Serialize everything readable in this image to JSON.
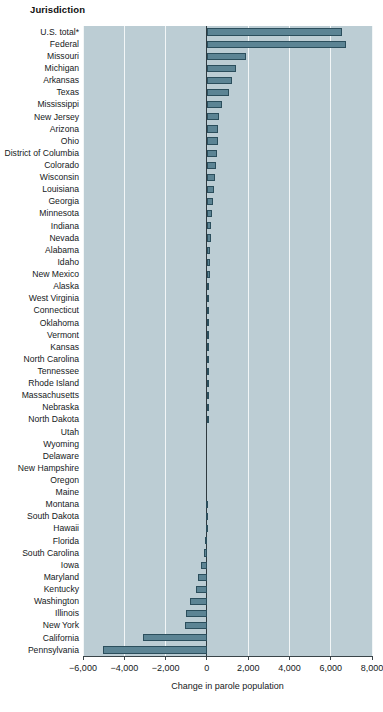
{
  "header": {
    "column_label": "Jurisdiction"
  },
  "chart_data": {
    "type": "bar",
    "orientation": "horizontal",
    "title": "",
    "xlabel": "Change in parole population",
    "ylabel": "Jurisdiction",
    "xlim": [
      -6000,
      8000
    ],
    "xticks": [
      -6000,
      -4000,
      -2000,
      0,
      2000,
      4000,
      6000,
      8000
    ],
    "xticklabels": [
      "−6,000",
      "−4,000",
      "−2,000",
      "0",
      "2,000",
      "4,000",
      "6,000",
      "8,000"
    ],
    "grid": true,
    "legend": "none",
    "zero_reference_line": true,
    "panel_color": "#bccdd4",
    "bar_fill": "#5c8494",
    "bar_edge": "#2b4e5c",
    "categories": [
      "U.S. total*",
      "Federal",
      "Missouri",
      "Michigan",
      "Arkansas",
      "Texas",
      "Mississippi",
      "New Jersey",
      "Arizona",
      "Ohio",
      "District of Columbia",
      "Colorado",
      "Wisconsin",
      "Louisiana",
      "Georgia",
      "Minnesota",
      "Indiana",
      "Nevada",
      "Alabama",
      "Idaho",
      "New Mexico",
      "Alaska",
      "West Virginia",
      "Connecticut",
      "Oklahoma",
      "Vermont",
      "Kansas",
      "North Carolina",
      "Tennessee",
      "Rhode Island",
      "Massachusetts",
      "Nebraska",
      "North Dakota",
      "Utah",
      "Wyoming",
      "Delaware",
      "New Hampshire",
      "Oregon",
      "Maine",
      "Montana",
      "South Dakota",
      "Hawaii",
      "Florida",
      "South Carolina",
      "Iowa",
      "Maryland",
      "Kentucky",
      "Washington",
      "Illinois",
      "New York",
      "California",
      "Pennsylvania"
    ],
    "values": [
      6550,
      6750,
      1900,
      1400,
      1200,
      1050,
      750,
      600,
      560,
      520,
      470,
      440,
      400,
      360,
      300,
      250,
      210,
      190,
      170,
      150,
      130,
      120,
      110,
      100,
      90,
      80,
      70,
      60,
      50,
      40,
      30,
      25,
      20,
      15,
      10,
      5,
      0,
      -5,
      -10,
      -20,
      -30,
      -60,
      -100,
      -160,
      -260,
      -420,
      -540,
      -800,
      -1000,
      -1050,
      -3100,
      -5050
    ]
  }
}
